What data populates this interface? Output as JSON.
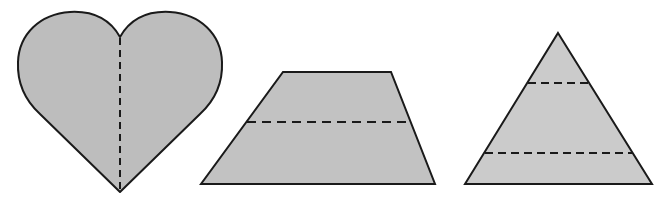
{
  "colors": {
    "background": "#ffffff",
    "heart_fill": "#bdbdbd",
    "trapezoid_fill": "#c2c2c2",
    "triangle_fill": "#cbcbcb",
    "stroke": "#1a1a1a"
  },
  "shapes": [
    {
      "name": "heart",
      "dashed_lines": 1,
      "orientation": "vertical"
    },
    {
      "name": "trapezoid",
      "dashed_lines": 1,
      "orientation": "horizontal"
    },
    {
      "name": "triangle",
      "dashed_lines": 2,
      "orientation": "horizontal"
    }
  ]
}
